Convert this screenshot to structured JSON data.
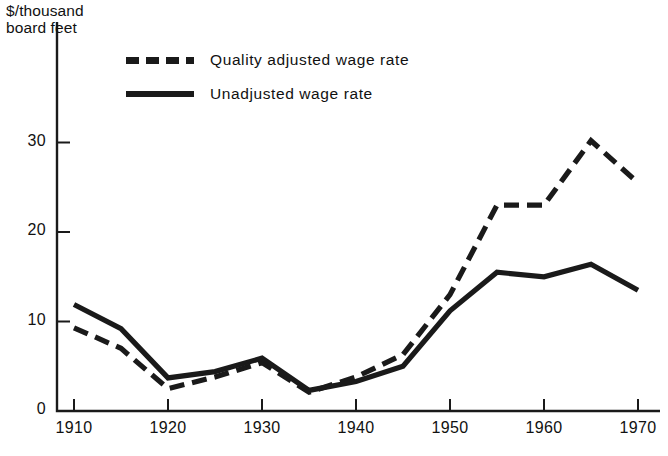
{
  "chart_data": {
    "type": "line",
    "title": "",
    "subtitle": "",
    "xlabel": "",
    "ylabel": "$/thousand board feet",
    "ylabel_line1": "$/thousand",
    "ylabel_line2": "board feet",
    "x": [
      1910,
      1915,
      1920,
      1925,
      1930,
      1935,
      1940,
      1945,
      1950,
      1955,
      1960,
      1965,
      1970
    ],
    "xlim": [
      1908,
      1972
    ],
    "ylim": [
      0,
      34
    ],
    "xticks": [
      1910,
      1920,
      1930,
      1940,
      1950,
      1960,
      1970
    ],
    "xtick_labels": [
      "1910",
      "1920",
      "1930",
      "1940",
      "1950",
      "1960",
      "1970"
    ],
    "yticks": [
      0,
      10,
      20,
      30
    ],
    "ytick_labels": [
      "0",
      "10",
      "20",
      "30"
    ],
    "grid": false,
    "legend_position": "top-center",
    "series": [
      {
        "name": "Quality adjusted wage rate",
        "style": "dashed",
        "color": "#1a1a1a",
        "values": [
          9.3,
          7.0,
          2.5,
          3.8,
          5.4,
          2.1,
          3.8,
          6.3,
          13.0,
          23.0,
          23.0,
          30.2,
          25.5
        ]
      },
      {
        "name": "Unadjusted wage rate",
        "style": "solid",
        "color": "#1a1a1a",
        "values": [
          11.9,
          9.2,
          3.7,
          4.4,
          5.9,
          2.3,
          3.3,
          5.0,
          11.2,
          15.5,
          15.0,
          16.4,
          13.5
        ]
      }
    ]
  },
  "legend": {
    "items": [
      {
        "label": "Quality adjusted wage rate",
        "style": "dashed"
      },
      {
        "label": "Unadjusted wage rate",
        "style": "solid"
      }
    ]
  }
}
